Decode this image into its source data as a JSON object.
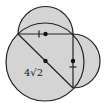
{
  "diagram": {
    "type": "geometry",
    "fill_color": "#d4d4d4",
    "stroke_color": "#222222",
    "label": "4√2",
    "shapes": {
      "large_circle": {
        "cx": 45,
        "cy": 62,
        "r": 39
      },
      "top_circle": {
        "cx": 45.5,
        "cy": 34,
        "r": 27.5
      },
      "right_circle": {
        "cx": 73,
        "cy": 61,
        "r": 27
      }
    },
    "segments": {
      "horizontal_diameter": {
        "x1": 18,
        "y1": 34,
        "x2": 73,
        "y2": 34
      },
      "vertical_diameter": {
        "x1": 73,
        "y1": 34,
        "x2": 73,
        "y2": 88
      },
      "diagonal": {
        "x1": 18,
        "y1": 34,
        "x2": 73,
        "y2": 88
      }
    },
    "points": [
      {
        "name": "top-circle-center",
        "x": 45.5,
        "y": 34
      },
      {
        "name": "large-circle-center",
        "x": 45.5,
        "y": 61
      },
      {
        "name": "right-circle-center",
        "x": 73,
        "y": 61
      }
    ],
    "tick_marks": [
      {
        "name": "tick-horizontal-segment",
        "x1": 39,
        "y1": 30.5,
        "x2": 39,
        "y2": 37.5
      },
      {
        "name": "tick-vertical-segment",
        "x1": 69.5,
        "y1": 67,
        "x2": 76.5,
        "y2": 67
      }
    ]
  }
}
